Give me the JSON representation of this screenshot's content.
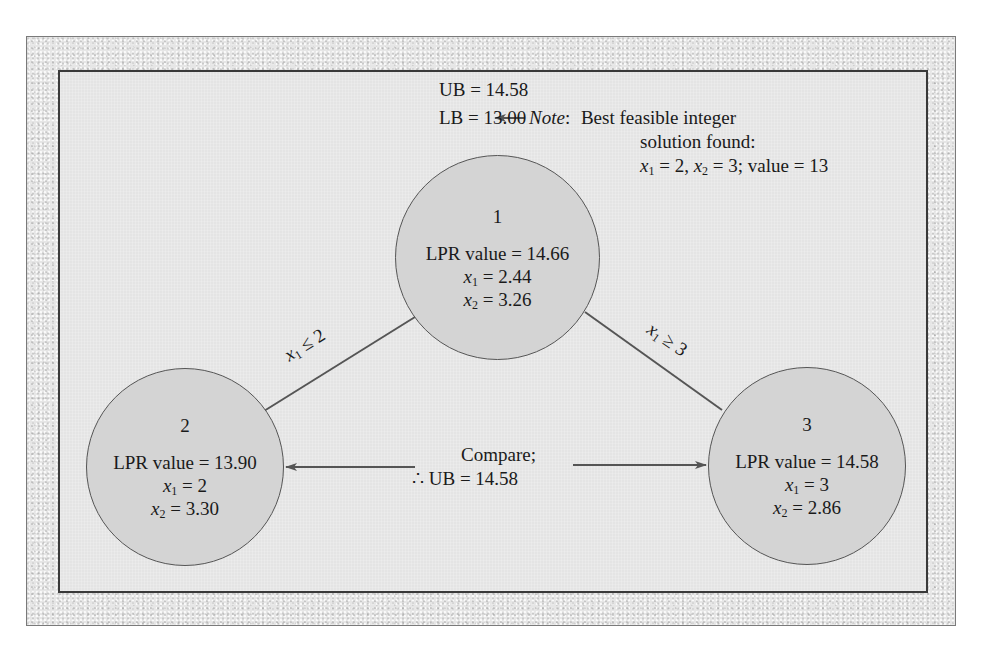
{
  "bounds": {
    "ub_label": "UB = 14.58",
    "lb_label": "LB = 13.00"
  },
  "note": {
    "label": "Note",
    "colon": ":",
    "line1": "Best feasible integer",
    "line2": "solution found:",
    "line3_x1": "x",
    "line3_x1_sub": "1",
    "line3_x1_val": " = 2, ",
    "line3_x2": "x",
    "line3_x2_sub": "2",
    "line3_rest": " = 3; value = 13"
  },
  "nodes": [
    {
      "id": "1",
      "lpr": "LPR value = 14.66",
      "x1_val": " = 2.44",
      "x2_val": " = 3.26"
    },
    {
      "id": "2",
      "lpr": "LPR value = 13.90",
      "x1_val": " = 2",
      "x2_val": " = 3.30"
    },
    {
      "id": "3",
      "lpr": "LPR value = 14.58",
      "x1_val": " = 3",
      "x2_val": " = 2.86"
    }
  ],
  "var_names": {
    "x": "x",
    "sub1": "1",
    "sub2": "2"
  },
  "edges": [
    {
      "from": "1",
      "to": "2",
      "label_var": "x",
      "label_sub": "1",
      "label_rest": " ≤ 2"
    },
    {
      "from": "1",
      "to": "3",
      "label_var": "x",
      "label_sub": "1",
      "label_rest": " ≥ 3"
    }
  ],
  "compare": {
    "line1": "Compare;",
    "line2": "∴ UB = 14.58"
  },
  "colors": {
    "node_fill": "#d4d4d4",
    "panel_fill": "#e4e4e4",
    "line": "#555555"
  }
}
